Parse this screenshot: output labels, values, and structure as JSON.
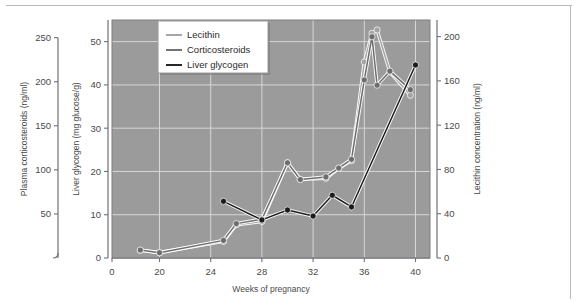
{
  "figure": {
    "background": "#ffffff",
    "plot_background": "#9b9b9b",
    "grid_color": "#d5d7d8",
    "axis_color": "#6e7174",
    "frame_color": "#b9bcbf"
  },
  "legend": {
    "position": "top-left-inside",
    "background": "#ffffff",
    "border_color": "#9a9a9a",
    "items": [
      {
        "label": "Lecithin",
        "color": "#a3a3a3"
      },
      {
        "label": "Corticosteroids",
        "color": "#6d6d6d"
      },
      {
        "label": "Liver glycogen",
        "color": "#1c1c1c"
      }
    ]
  },
  "axes": {
    "x": {
      "title": "Weeks of pregnancy",
      "ticks": [
        0,
        20,
        24,
        28,
        32,
        36,
        40
      ],
      "tick_labels": [
        "0",
        "20",
        "24",
        "28",
        "32",
        "36",
        "40"
      ],
      "broken_axis": true,
      "note": "axis has a break between 0 and 20"
    },
    "y_left_outer": {
      "title": "Plasma corticosteroids (ng/ml)",
      "ticks": [
        50,
        100,
        150,
        200,
        250
      ],
      "tick_labels": [
        "50",
        "100",
        "150",
        "200",
        "250"
      ],
      "range": [
        0,
        270
      ],
      "units": "ng/ml"
    },
    "y_left_inner": {
      "title": "Liver glycogen (mg glucose/g)",
      "ticks": [
        0,
        10,
        20,
        30,
        40,
        50
      ],
      "tick_labels": [
        "0",
        "10",
        "20",
        "30",
        "40",
        "50"
      ],
      "range": [
        0,
        55
      ],
      "units": "mg glucose/g"
    },
    "y_right": {
      "title": "Lecithin concentration (ng/ml)",
      "ticks": [
        0,
        40,
        80,
        120,
        160,
        200
      ],
      "tick_labels": [
        "0",
        "40",
        "80",
        "120",
        "160",
        "200"
      ],
      "range": [
        0,
        215
      ],
      "units": "ng/ml"
    }
  },
  "chart_data": {
    "type": "line",
    "title": "",
    "xlabel": "Weeks of pregnancy",
    "ylabel": "Plasma corticosteroids (ng/ml) / Liver glycogen (mg glucose/g)",
    "ylabel_right": "Lecithin concentration (ng/ml)",
    "xlim": [
      18,
      41
    ],
    "grid": true,
    "legend_position": "upper left",
    "marker": "filled-circle",
    "series": [
      {
        "name": "Lecithin",
        "color": "#a3a3a3",
        "axis": "y_right",
        "units": "ng/ml",
        "x": [
          18.5,
          20,
          25,
          26,
          28,
          30,
          31,
          33,
          34,
          35,
          36,
          36.6,
          37,
          38,
          39.6
        ],
        "values": [
          7,
          5,
          15,
          30,
          33,
          86,
          71,
          72,
          81,
          88,
          177,
          203,
          206,
          168,
          147
        ]
      },
      {
        "name": "Corticosteroids",
        "color": "#6d6d6d",
        "axis": "y_left_outer",
        "units": "ng/ml",
        "x": [
          18.5,
          20,
          25,
          26,
          28,
          30,
          31,
          33,
          34,
          35,
          36,
          36.6,
          37,
          38,
          39.6
        ],
        "values": [
          9,
          6,
          20,
          39,
          44,
          108,
          89,
          92,
          102,
          112,
          202,
          251,
          196,
          212,
          191
        ]
      },
      {
        "name": "Liver glycogen",
        "color": "#1c1c1c",
        "axis": "y_left_inner",
        "units": "mg glucose/g",
        "x": [
          25,
          28,
          30,
          32,
          33.5,
          35,
          40
        ],
        "values": [
          13.1,
          8.8,
          11.1,
          9.7,
          14.5,
          11.8,
          44.6
        ]
      }
    ]
  }
}
